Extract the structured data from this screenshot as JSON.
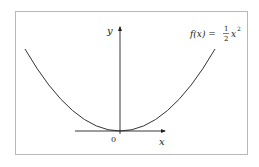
{
  "diagram": {
    "function_label": {
      "lhs": "f(x) =",
      "frac_num": "1",
      "frac_den": "2",
      "rhs_base": "x",
      "rhs_exp": "2"
    },
    "axes": {
      "x_label": "x",
      "y_label": "y",
      "origin_label": "0"
    },
    "curve": {
      "type": "parabola",
      "equation": "f(x) = 1/2 x^2",
      "color": "#333333"
    },
    "colors": {
      "frame_border": "#b8b8b8",
      "axis": "#222222",
      "background": "#ffffff"
    }
  }
}
